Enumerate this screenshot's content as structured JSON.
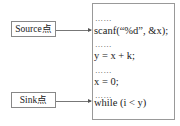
{
  "diagram": {
    "source_label": "Source点",
    "sink_label": "Sink点",
    "code_lines": [
      {
        "type": "ellipsis",
        "text": "……"
      },
      {
        "type": "code",
        "text": "scanf(“%d”, &x);"
      },
      {
        "type": "ellipsis",
        "text": "……"
      },
      {
        "type": "code",
        "text": "y = x + k;"
      },
      {
        "type": "ellipsis",
        "text": "……"
      },
      {
        "type": "code",
        "text": "x = 0;"
      },
      {
        "type": "ellipsis",
        "text": "……"
      },
      {
        "type": "code",
        "text": "while (i < y)"
      }
    ],
    "edges": [
      {
        "from": "Source点",
        "to": "scanf(“%d”, &x);"
      },
      {
        "from": "Sink点",
        "to": "while (i < y)"
      }
    ]
  }
}
